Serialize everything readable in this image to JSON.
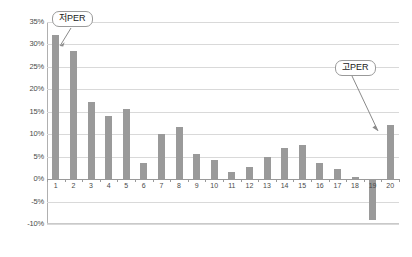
{
  "chart_data": {
    "type": "bar",
    "title": "",
    "subtitle": "",
    "xlabel": "",
    "ylabel": "",
    "categories": [
      "1",
      "2",
      "3",
      "4",
      "5",
      "6",
      "7",
      "8",
      "9",
      "10",
      "11",
      "12",
      "13",
      "14",
      "15",
      "16",
      "17",
      "18",
      "19",
      "20"
    ],
    "values": [
      32.0,
      28.6,
      17.1,
      14.0,
      15.7,
      3.5,
      10.0,
      11.5,
      5.5,
      4.3,
      1.5,
      2.8,
      5.0,
      7.0,
      7.6,
      3.6,
      2.3,
      0.4,
      -9.0,
      12.0
    ],
    "series": [
      {
        "name": "",
        "values": [
          32.0,
          28.6,
          17.1,
          14.0,
          15.7,
          3.5,
          10.0,
          11.5,
          5.5,
          4.3,
          1.5,
          2.8,
          5.0,
          7.0,
          7.6,
          3.6,
          2.3,
          0.4,
          -9.0,
          12.0
        ]
      }
    ],
    "ylim": [
      -10,
      35
    ],
    "ytick_labels": [
      "35%",
      "30%",
      "25%",
      "20%",
      "15%",
      "10%",
      "5%",
      "0%",
      "-5%",
      "-10%"
    ],
    "ytick_values": [
      35,
      30,
      25,
      20,
      15,
      10,
      5,
      0,
      -5,
      -10
    ],
    "xtick_labels": [
      "1",
      "2",
      "3",
      "4",
      "5",
      "6",
      "7",
      "8",
      "9",
      "10",
      "11",
      "12",
      "13",
      "14",
      "15",
      "16",
      "17",
      "18",
      "19",
      "20"
    ],
    "grid": true,
    "legend": "none",
    "unit": "%",
    "bar_color": "#9a9a9a",
    "gridline_color": "#d9d9d9",
    "axis_color": "#9a9a9a",
    "annotations": [
      {
        "id": "low-per",
        "label": "저PER",
        "points_to_category": "1"
      },
      {
        "id": "high-per",
        "label": "고PER",
        "points_to_category": "20"
      }
    ]
  }
}
